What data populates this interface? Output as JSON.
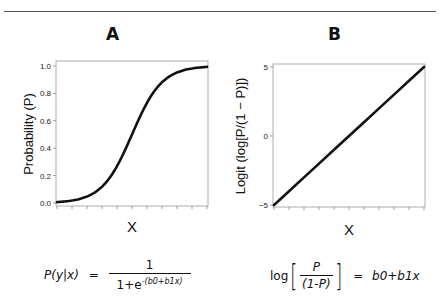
{
  "panels": {
    "A": {
      "letter": "A",
      "xlabel": "X",
      "ylabel": "Probability  (P)",
      "yticks": [
        "0.0",
        "0.2",
        "0.4",
        "0.6",
        "0.8",
        "1.0"
      ],
      "equation": {
        "lhs": "P(y|x)",
        "equals": "=",
        "numerator": "1",
        "denominator_base": "1+e",
        "denominator_exponent": "-(b0+b1x)"
      }
    },
    "B": {
      "letter": "B",
      "xlabel": "X",
      "ylabel": "Logit  (log[P/(1 − P)])",
      "yticks": [
        "−5",
        "0",
        "5"
      ],
      "equation": {
        "log": "log",
        "numerator": "P",
        "denominator": "(1-P)",
        "equals": "=",
        "rhs": "b0+b1x"
      }
    }
  },
  "colors": {
    "curve": "#111111",
    "frame": "#999999",
    "rule": "#555555"
  },
  "chart_data": [
    {
      "type": "line",
      "title": "A",
      "xlabel": "X",
      "ylabel": "Probability (P)",
      "ylim": [
        0,
        1
      ],
      "yticks": [
        0.0,
        0.2,
        0.4,
        0.6,
        0.8,
        1.0
      ],
      "x_tick_count": 11,
      "x_tick_labels": [],
      "grid": false,
      "series": [
        {
          "name": "logistic",
          "x": [
            0,
            0.1,
            0.2,
            0.3,
            0.4,
            0.5,
            0.6,
            0.7,
            0.8,
            0.9,
            1.0
          ],
          "values": [
            0.007,
            0.018,
            0.047,
            0.119,
            0.269,
            0.5,
            0.731,
            0.881,
            0.953,
            0.982,
            0.993
          ]
        }
      ]
    },
    {
      "type": "line",
      "title": "B",
      "xlabel": "X",
      "ylabel": "Logit (log[P/(1 − P)])",
      "ylim": [
        -5,
        5
      ],
      "yticks": [
        -5,
        0,
        5
      ],
      "x_tick_count": 11,
      "x_tick_labels": [],
      "grid": false,
      "series": [
        {
          "name": "logit",
          "x": [
            0,
            0.1,
            0.2,
            0.3,
            0.4,
            0.5,
            0.6,
            0.7,
            0.8,
            0.9,
            1.0
          ],
          "values": [
            -5,
            -4,
            -3,
            -2,
            -1,
            0,
            1,
            2,
            3,
            4,
            5
          ]
        }
      ]
    }
  ]
}
